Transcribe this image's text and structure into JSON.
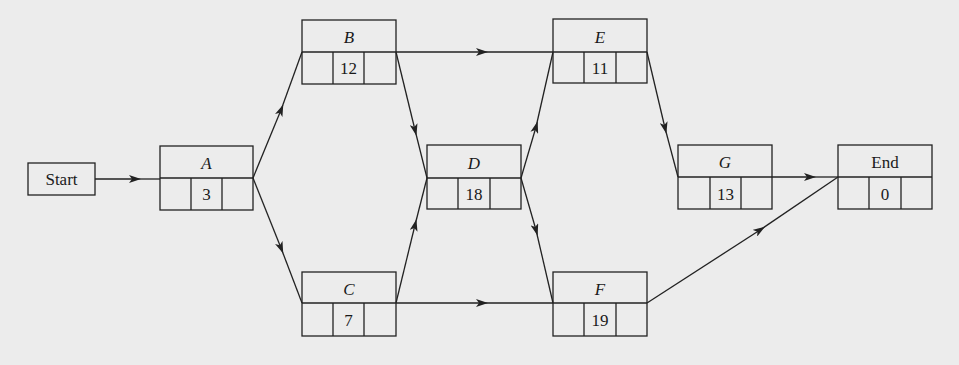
{
  "diagram": {
    "type": "activity-on-node network",
    "start": {
      "label": "Start"
    },
    "nodes": [
      {
        "id": "A",
        "label": "A",
        "duration": "3"
      },
      {
        "id": "B",
        "label": "B",
        "duration": "12"
      },
      {
        "id": "C",
        "label": "C",
        "duration": "7"
      },
      {
        "id": "D",
        "label": "D",
        "duration": "18"
      },
      {
        "id": "E",
        "label": "E",
        "duration": "11"
      },
      {
        "id": "F",
        "label": "F",
        "duration": "19"
      },
      {
        "id": "G",
        "label": "G",
        "duration": "13"
      },
      {
        "id": "End",
        "label": "End",
        "duration": "0"
      }
    ],
    "edges": [
      {
        "from": "Start",
        "to": "A"
      },
      {
        "from": "A",
        "to": "B"
      },
      {
        "from": "A",
        "to": "C"
      },
      {
        "from": "B",
        "to": "E"
      },
      {
        "from": "B",
        "to": "D"
      },
      {
        "from": "C",
        "to": "D"
      },
      {
        "from": "C",
        "to": "F"
      },
      {
        "from": "D",
        "to": "E"
      },
      {
        "from": "D",
        "to": "F"
      },
      {
        "from": "E",
        "to": "G"
      },
      {
        "from": "G",
        "to": "End"
      },
      {
        "from": "F",
        "to": "End"
      }
    ]
  },
  "colors": {
    "background": "#ececec",
    "stroke": "#222222"
  }
}
